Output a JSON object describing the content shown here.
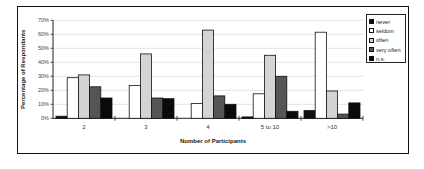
{
  "chart_data": {
    "type": "bar",
    "title": "",
    "xlabel": "Number of Participants",
    "ylabel": "Percentage of Respondants",
    "ylim": [
      0,
      70
    ],
    "yticks": [
      "0%",
      "10%",
      "20%",
      "30%",
      "40%",
      "50%",
      "60%",
      "70%"
    ],
    "grid": true,
    "legend_position": "right",
    "categories": [
      "2",
      "3",
      "4",
      "5 to 10",
      ">10"
    ],
    "series": [
      {
        "name": "never",
        "color": "#111111",
        "values": [
          1.5,
          0,
          0,
          1,
          5.5
        ]
      },
      {
        "name": "seldom",
        "color": "#ffffff",
        "values": [
          29,
          23.5,
          10.5,
          17.5,
          61.5
        ]
      },
      {
        "name": "often",
        "color": "#d4d4d4",
        "values": [
          31,
          46,
          63,
          45,
          19.5
        ]
      },
      {
        "name": "very often",
        "color": "#555555",
        "values": [
          22.5,
          14.5,
          16,
          30,
          3
        ]
      },
      {
        "name": "n.s.",
        "color": "#0a0a0a",
        "values": [
          14.5,
          14,
          10,
          5,
          11
        ]
      }
    ]
  }
}
